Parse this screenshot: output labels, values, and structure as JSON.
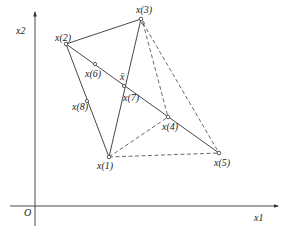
{
  "diagram": {
    "title": "",
    "axes": {
      "origin_label": "O",
      "x_label": "x1",
      "y_label": "x2"
    },
    "points": [
      {
        "id": "x1",
        "label": "x(1)",
        "x": 109,
        "y": 157
      },
      {
        "id": "x2",
        "label": "x(2)",
        "x": 66,
        "y": 44
      },
      {
        "id": "x3",
        "label": "x(3)",
        "x": 141,
        "y": 19
      },
      {
        "id": "x4",
        "label": "x(4)",
        "x": 168,
        "y": 117
      },
      {
        "id": "x5",
        "label": "x(5)",
        "x": 219,
        "y": 153
      },
      {
        "id": "x6",
        "label": "x(6)",
        "x": 95,
        "y": 64
      },
      {
        "id": "x7",
        "label": "x(7)",
        "x": 124,
        "y": 86
      },
      {
        "id": "x8",
        "label": "x(8)",
        "x": 87,
        "y": 101
      }
    ],
    "centroid_label": "x̄",
    "solid_edges": [
      [
        "x1",
        "x2"
      ],
      [
        "x2",
        "x3"
      ],
      [
        "x3",
        "x1"
      ],
      [
        "x2",
        "x5"
      ]
    ],
    "dashed_edges": [
      [
        "x3",
        "x4"
      ],
      [
        "x3",
        "x5"
      ],
      [
        "x1",
        "x4"
      ],
      [
        "x1",
        "x5"
      ]
    ]
  }
}
